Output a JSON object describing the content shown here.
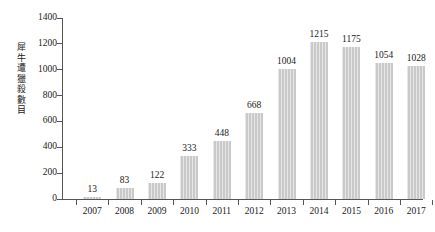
{
  "chart_data": {
    "type": "bar",
    "title": "",
    "subtitle": "",
    "xlabel": "",
    "ylabel": "犀牛遭獵殺數目",
    "categories": [
      "2007",
      "2008",
      "2009",
      "2010",
      "2011",
      "2012",
      "2013",
      "2014",
      "2015",
      "2016",
      "2017"
    ],
    "values": [
      13,
      83,
      122,
      333,
      448,
      668,
      1004,
      1215,
      1175,
      1054,
      1028
    ],
    "value_labels": [
      "13",
      "83",
      "122",
      "333",
      "448",
      "668",
      "1004",
      "1215",
      "1175",
      "1054",
      "1028"
    ],
    "ylim": [
      0,
      1400
    ],
    "ytick_values": [
      0,
      200,
      400,
      600,
      800,
      1000,
      1200,
      1400
    ],
    "ytick_labels": [
      "0",
      "200",
      "400",
      "600",
      "800",
      "1000",
      "1200",
      "1400"
    ],
    "grid": false,
    "legend": null,
    "bar_color": "#c9c9c9",
    "axis_color": "#555555",
    "text_color": "#1a1a1a",
    "background": "#ffffff"
  }
}
